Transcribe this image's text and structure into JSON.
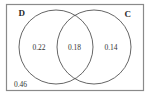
{
  "diagram": {
    "type": "venn",
    "sets": [
      {
        "name": "D",
        "label": "D"
      },
      {
        "name": "C",
        "label": "C"
      }
    ],
    "regions": {
      "d_only": "0.22",
      "d_and_c": "0.18",
      "c_only": "0.14",
      "neither": "0.46"
    },
    "colors": {
      "border": "#7a7a7a",
      "circle": "#555555",
      "text": "#333333"
    }
  }
}
